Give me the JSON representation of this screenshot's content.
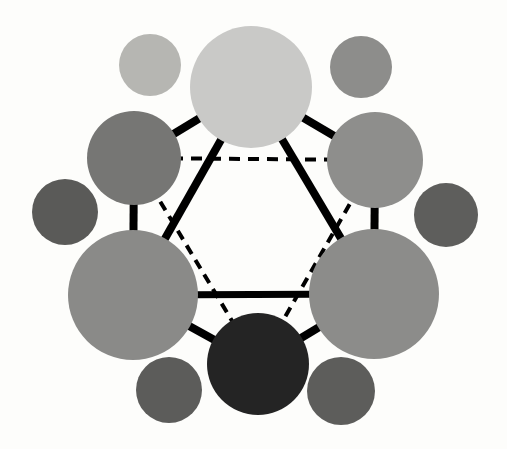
{
  "figure": {
    "width": 507,
    "height": 449,
    "background_color": "#fdfdfb"
  },
  "chart_data": {
    "type": "scatter",
    "xlabel": "",
    "ylabel": "",
    "xlim": [
      0,
      507
    ],
    "ylim": [
      0,
      449
    ],
    "grid": false,
    "legend": "none",
    "nodes": [
      {
        "id": "node-top",
        "label": "top",
        "role": "primary",
        "cx": 251,
        "cy": 87,
        "r": 61,
        "fill": "#c9c9c7",
        "tone": "very-light-gray"
      },
      {
        "id": "node-upper-right",
        "label": "upper-right",
        "role": "primary",
        "cx": 375,
        "cy": 160,
        "r": 48,
        "fill": "#8e8e8c",
        "tone": "medium-gray"
      },
      {
        "id": "node-lower-right",
        "label": "lower-right",
        "role": "primary",
        "cx": 374,
        "cy": 294,
        "r": 65,
        "fill": "#8c8c8a",
        "tone": "medium-gray"
      },
      {
        "id": "node-bottom",
        "label": "bottom",
        "role": "primary",
        "cx": 258,
        "cy": 364,
        "r": 51,
        "fill": "#242424",
        "tone": "near-black"
      },
      {
        "id": "node-lower-left",
        "label": "lower-left",
        "role": "primary",
        "cx": 133,
        "cy": 295,
        "r": 65,
        "fill": "#8a8a88",
        "tone": "medium-gray"
      },
      {
        "id": "node-upper-left",
        "label": "upper-left",
        "role": "primary",
        "cx": 134,
        "cy": 158,
        "r": 47,
        "fill": "#767674",
        "tone": "dark-medium-gray"
      },
      {
        "id": "satellite-top-left",
        "label": "satellite-top-left",
        "role": "satellite",
        "cx": 150,
        "cy": 65,
        "r": 31,
        "fill": "#b6b6b2",
        "tone": "light-gray"
      },
      {
        "id": "satellite-top-right",
        "label": "satellite-top-right",
        "role": "satellite",
        "cx": 361,
        "cy": 67,
        "r": 31,
        "fill": "#8d8d8b",
        "tone": "medium-gray"
      },
      {
        "id": "satellite-right",
        "label": "satellite-right",
        "role": "satellite",
        "cx": 446,
        "cy": 215,
        "r": 32,
        "fill": "#5e5e5c",
        "tone": "dark-gray"
      },
      {
        "id": "satellite-bottom-right",
        "label": "satellite-bottom-right",
        "role": "satellite",
        "cx": 341,
        "cy": 391,
        "r": 34,
        "fill": "#5d5d5b",
        "tone": "dark-gray"
      },
      {
        "id": "satellite-bottom-left",
        "label": "satellite-bottom-left",
        "role": "satellite",
        "cx": 169,
        "cy": 390,
        "r": 33,
        "fill": "#5c5c5a",
        "tone": "dark-gray"
      },
      {
        "id": "satellite-left",
        "label": "satellite-left",
        "role": "satellite",
        "cx": 65,
        "cy": 212,
        "r": 33,
        "fill": "#5a5a58",
        "tone": "dark-gray"
      }
    ],
    "edges_solid": [
      {
        "id": "edge-top-to-upper-right",
        "from": "node-top",
        "to": "node-upper-right",
        "style": "solid",
        "width": 8,
        "color": "#000000"
      },
      {
        "id": "edge-upper-right-to-lower-right",
        "from": "node-upper-right",
        "to": "node-lower-right",
        "style": "solid",
        "width": 8,
        "color": "#000000"
      },
      {
        "id": "edge-lower-right-to-bottom",
        "from": "node-lower-right",
        "to": "node-bottom",
        "style": "solid",
        "width": 8,
        "color": "#000000"
      },
      {
        "id": "edge-bottom-to-lower-left",
        "from": "node-bottom",
        "to": "node-lower-left",
        "style": "solid",
        "width": 8,
        "color": "#000000"
      },
      {
        "id": "edge-lower-left-to-upper-left",
        "from": "node-lower-left",
        "to": "node-upper-left",
        "style": "solid",
        "width": 8,
        "color": "#000000"
      },
      {
        "id": "edge-upper-left-to-top",
        "from": "node-upper-left",
        "to": "node-top",
        "style": "solid",
        "width": 8,
        "color": "#000000"
      },
      {
        "id": "edge-inner-left-diagonal",
        "from": "node-top",
        "to": "node-lower-left",
        "style": "solid",
        "width": 8,
        "color": "#000000"
      },
      {
        "id": "edge-inner-right-diagonal",
        "from": "node-top",
        "to": "node-lower-right",
        "style": "solid",
        "width": 8,
        "color": "#000000"
      },
      {
        "id": "edge-inner-horizontal",
        "from": "node-lower-left",
        "to": "node-lower-right",
        "style": "solid",
        "width": 7,
        "color": "#000000"
      }
    ],
    "edges_dashed": [
      {
        "id": "edge-dashed-upper-left-to-upper-right",
        "from": "node-upper-left",
        "to": "node-upper-right",
        "style": "dashed",
        "width": 4,
        "color": "#000000",
        "dasharray": "11 8"
      },
      {
        "id": "edge-dashed-upper-left-to-bottom",
        "from": "node-upper-left",
        "to": "node-bottom",
        "style": "dashed",
        "width": 4,
        "color": "#000000",
        "dasharray": "10 7"
      },
      {
        "id": "edge-dashed-upper-right-to-bottom",
        "from": "node-upper-right",
        "to": "node-bottom",
        "style": "dashed",
        "width": 4,
        "color": "#000000",
        "dasharray": "10 7"
      }
    ],
    "counts": {
      "primary_nodes": 6,
      "satellite_nodes": 6,
      "solid_edges": 9,
      "dashed_edges": 3
    }
  }
}
